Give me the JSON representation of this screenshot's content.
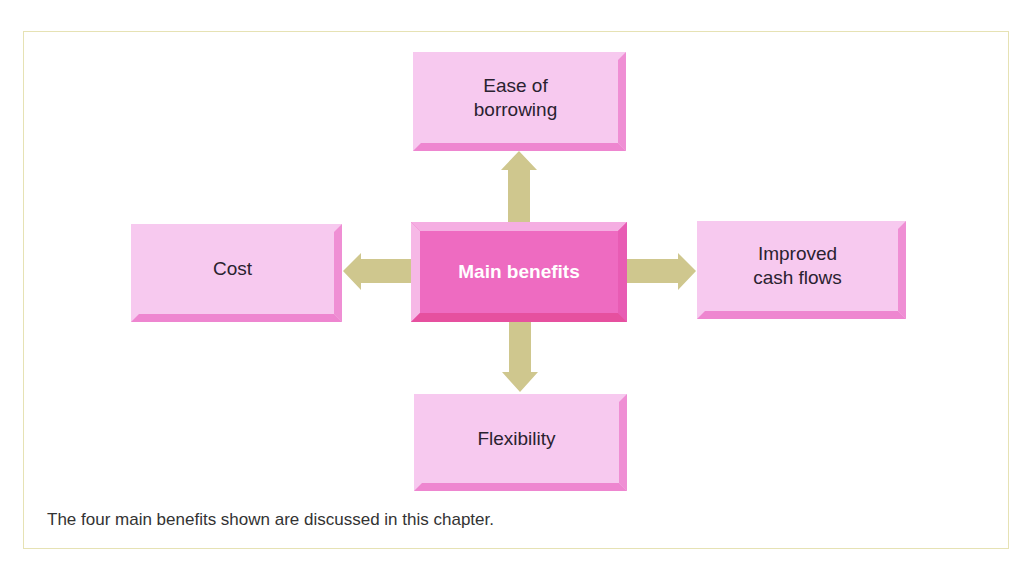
{
  "diagram": {
    "center": {
      "label": "Main benefits"
    },
    "nodes": [
      {
        "id": "top",
        "label": "Ease of\nborrowing",
        "direction": "up"
      },
      {
        "id": "left",
        "label": "Cost",
        "direction": "left"
      },
      {
        "id": "right",
        "label": "Improved\ncash flows",
        "direction": "right"
      },
      {
        "id": "bottom",
        "label": "Flexibility",
        "direction": "down"
      }
    ],
    "caption": "The four main benefits shown are discussed in this chapter.",
    "colors": {
      "box_fill": "#f7c9ef",
      "box_bevel": "#ef8fd4",
      "center_fill": "#ee6bc1",
      "center_text": "#ffffff",
      "arrow": "#cfc78e",
      "frame": "#e6e2b4"
    }
  }
}
